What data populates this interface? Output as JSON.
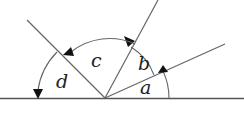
{
  "diagram": {
    "labels": {
      "a": "a",
      "b": "b",
      "c": "c",
      "d": "d"
    },
    "colors": {
      "line": "#555555",
      "arc": "#555555",
      "arrow": "#111111",
      "text": "#222222"
    }
  }
}
